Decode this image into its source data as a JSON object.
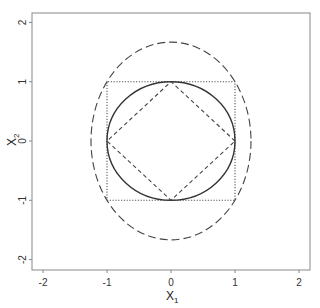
{
  "chart_data": {
    "type": "line",
    "title": "",
    "xlabel": "X",
    "xlabel_subscript": "1",
    "ylabel": "X",
    "ylabel_subscript": "2",
    "xlim": [
      -2.2,
      2.15
    ],
    "ylim": [
      -2.2,
      2.15
    ],
    "x_ticks": [
      -2,
      -1,
      0,
      1,
      2
    ],
    "y_ticks": [
      -2,
      -1,
      0,
      1,
      2
    ],
    "x_tick_labels": [
      "-2",
      "-1",
      "0",
      "1",
      "2"
    ],
    "y_tick_labels": [
      "-2",
      "-1",
      "0",
      "1",
      "2"
    ],
    "grid": false,
    "legend": null,
    "series": [
      {
        "name": "square",
        "shape": "square",
        "linestyle": "dotted",
        "color": "#555555",
        "points": [
          [
            -1,
            -1
          ],
          [
            1,
            -1
          ],
          [
            1,
            1
          ],
          [
            -1,
            1
          ],
          [
            -1,
            -1
          ]
        ]
      },
      {
        "name": "circle",
        "shape": "circle",
        "linestyle": "solid",
        "color": "#333333",
        "center": [
          0,
          0
        ],
        "radius": 1
      },
      {
        "name": "diamond",
        "shape": "diamond",
        "linestyle": "dashed",
        "color": "#444444",
        "points": [
          [
            1,
            0
          ],
          [
            0,
            1
          ],
          [
            -1,
            0
          ],
          [
            0,
            -1
          ],
          [
            1,
            0
          ]
        ]
      },
      {
        "name": "ellipse",
        "shape": "ellipse",
        "linestyle": "longdash",
        "color": "#444444",
        "center": [
          0,
          0
        ],
        "semi_axis_x": 1.25,
        "semi_axis_y": 1.667
      }
    ]
  }
}
